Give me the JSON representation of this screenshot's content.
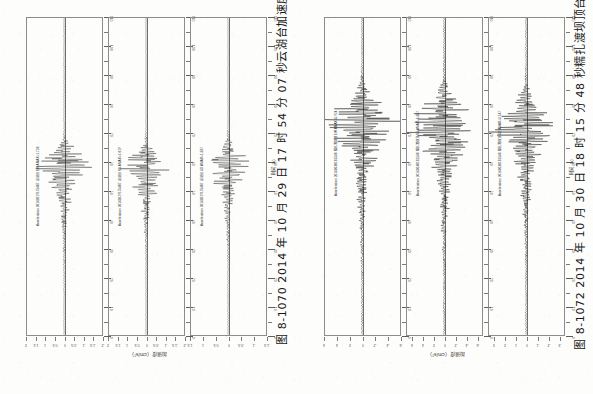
{
  "page": {
    "background": "#fdfdfc",
    "ink": "#1a1a1a",
    "orientation": "rotated-90"
  },
  "figures": [
    {
      "id": "fig-8-1070",
      "caption": "图 8-1070  2014 年 10 月 29 日 17 时 54 分 07 秒云湖台加速度记录",
      "figure_number": "图 8-1070",
      "date_text": "2014 年 10 月 29 日 17 时 54 分 07 秒",
      "station_text": "云湖台加速度记录",
      "xlabel": "时间（s）",
      "ylabel": "加速度（cm/s²）",
      "channels": [
        {
          "name": "channel-ew",
          "record_label": "Acceleration 20141029175407 云湖台 EW AMAX=1.736"
        },
        {
          "name": "channel-ns",
          "record_label": "Acceleration 20141029175407 云湖台 NS AMAX=1.819"
        },
        {
          "name": "channel-ud",
          "record_label": "Acceleration 20141029175407 云湖台 UD AMAX=1.387"
        }
      ]
    },
    {
      "id": "fig-8-1072",
      "caption": "图 8-1072  2014 年 10 月 30 日 18 时 15 分 48 秒糯扎渡坝顶台加速度记录",
      "figure_number": "图 8-1072",
      "date_text": "2014 年 10 月 30 日 18 时 15 分 48 秒",
      "station_text": "糯扎渡坝顶台加速度记录",
      "xlabel": "时间（s）",
      "ylabel": "加速度（cm/s²）",
      "channels": [
        {
          "name": "channel-ew",
          "record_label": "Acceleration 20141030181548 糯扎渡坝顶 EW AMAX=5.924"
        },
        {
          "name": "channel-ns",
          "record_label": "Acceleration 20141030181548 糯扎渡坝顶 NS AMAX=6.387"
        },
        {
          "name": "channel-ud",
          "record_label": "Acceleration 20141030181548 糯扎渡坝顶 UD AMAX=3.147"
        }
      ]
    }
  ],
  "chart_data": [
    {
      "type": "line",
      "name": "fig-8-1070-channel-ew",
      "title": "Acceleration 20141029175407 云湖台 EW AMAX=1.736",
      "xlabel": "时间（s）",
      "ylabel": "加速度（cm/s²）",
      "xlim": [
        0,
        110
      ],
      "ylim": [
        -2.0,
        2.0
      ],
      "xticks": [
        0,
        5,
        10,
        15,
        20,
        25,
        30,
        35,
        40,
        45,
        50,
        55,
        60,
        65,
        70,
        75,
        80,
        85,
        90,
        95,
        100,
        105,
        110
      ],
      "yticks": [
        -2.0,
        -1.5,
        -1.0,
        -0.5,
        0,
        0.5,
        1.0,
        1.5,
        2.0
      ],
      "peak_time_s": 47,
      "peak_amplitude": 1.736,
      "grid": false,
      "legend": "none"
    },
    {
      "type": "line",
      "name": "fig-8-1070-channel-ns",
      "title": "Acceleration 20141029175407 云湖台 NS AMAX=1.819",
      "xlabel": "时间（s）",
      "ylabel": "加速度（cm/s²）",
      "xlim": [
        0,
        110
      ],
      "ylim": [
        -2.0,
        2.0
      ],
      "xticks": [
        0,
        5,
        10,
        15,
        20,
        25,
        30,
        35,
        40,
        45,
        50,
        55,
        60,
        65,
        70,
        75,
        80,
        85,
        90,
        95,
        100,
        105,
        110
      ],
      "yticks": [
        -2.0,
        -1.5,
        -1.0,
        -0.5,
        0,
        0.5,
        1.0,
        1.5,
        2.0
      ],
      "peak_time_s": 47,
      "peak_amplitude": 1.819,
      "grid": false,
      "legend": "none"
    },
    {
      "type": "line",
      "name": "fig-8-1070-channel-ud",
      "title": "Acceleration 20141029175407 云湖台 UD AMAX=1.387",
      "xlabel": "时间（s）",
      "ylabel": "加速度（cm/s²）",
      "xlim": [
        0,
        110
      ],
      "ylim": [
        -1.5,
        1.5
      ],
      "xticks": [
        0,
        5,
        10,
        15,
        20,
        25,
        30,
        35,
        40,
        45,
        50,
        55,
        60,
        65,
        70,
        75,
        80,
        85,
        90,
        95,
        100,
        105,
        110
      ],
      "yticks": [
        -1.5,
        -1.0,
        -0.5,
        0,
        0.5,
        1.0,
        1.5
      ],
      "peak_time_s": 47,
      "peak_amplitude": 1.387,
      "grid": false,
      "legend": "none"
    },
    {
      "type": "line",
      "name": "fig-8-1072-channel-ew",
      "title": "Acceleration 20141030181548 糯扎渡坝顶 EW AMAX=5.924",
      "xlabel": "时间（s）",
      "ylabel": "加速度（cm/s²）",
      "xlim": [
        0,
        110
      ],
      "ylim": [
        -6.0,
        6.0
      ],
      "xticks": [
        0,
        5,
        10,
        15,
        20,
        25,
        30,
        35,
        40,
        45,
        50,
        55,
        60,
        65,
        70,
        75,
        80,
        85,
        90,
        95,
        100,
        105,
        110
      ],
      "yticks": [
        -6,
        -4,
        -2,
        0,
        2,
        4,
        6
      ],
      "peak_time_s": 34,
      "peak_amplitude": 5.924,
      "grid": false,
      "legend": "none"
    },
    {
      "type": "line",
      "name": "fig-8-1072-channel-ns",
      "title": "Acceleration 20141030181548 糯扎渡坝顶 NS AMAX=6.387",
      "xlabel": "时间（s）",
      "ylabel": "加速度（cm/s²）",
      "xlim": [
        0,
        110
      ],
      "ylim": [
        -7.0,
        7.0
      ],
      "xticks": [
        0,
        5,
        10,
        15,
        20,
        25,
        30,
        35,
        40,
        45,
        50,
        55,
        60,
        65,
        70,
        75,
        80,
        85,
        90,
        95,
        100,
        105,
        110
      ],
      "yticks": [
        -6,
        -4,
        -2,
        0,
        2,
        4,
        6
      ],
      "peak_time_s": 34,
      "peak_amplitude": 6.387,
      "grid": false,
      "legend": "none"
    },
    {
      "type": "line",
      "name": "fig-8-1072-channel-ud",
      "title": "Acceleration 20141030181548 糯扎渡坝顶 UD AMAX=3.147",
      "xlabel": "时间（s）",
      "ylabel": "加速度（cm/s²）",
      "xlim": [
        0,
        110
      ],
      "ylim": [
        -3.5,
        3.5
      ],
      "xticks": [
        0,
        5,
        10,
        15,
        20,
        25,
        30,
        35,
        40,
        45,
        50,
        55,
        60,
        65,
        70,
        75,
        80,
        85,
        90,
        95,
        100,
        105,
        110
      ],
      "yticks": [
        -3,
        -2,
        -1,
        0,
        1,
        2,
        3
      ],
      "peak_time_s": 34,
      "peak_amplitude": 3.147,
      "grid": false,
      "legend": "none"
    }
  ]
}
